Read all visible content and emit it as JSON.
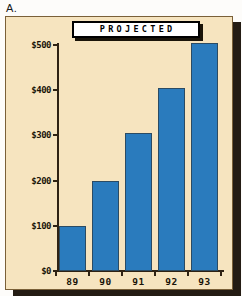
{
  "figure": {
    "letter": "A."
  },
  "chart_data": {
    "type": "bar",
    "title": "PROJECTED",
    "categories": [
      "89",
      "90",
      "91",
      "92",
      "93"
    ],
    "values": [
      100,
      200,
      305,
      405,
      505
    ],
    "xlabel": "Year",
    "ylabel": "",
    "ylim": [
      0,
      500
    ],
    "yticks": [
      0,
      100,
      200,
      300,
      400,
      500
    ],
    "ytick_labels": [
      "$0",
      "$100",
      "$200",
      "$300",
      "$400",
      "$500"
    ],
    "grid": false,
    "legend": "none",
    "series_color": "#2a7bbd",
    "background_color": "#f6e4bf"
  }
}
